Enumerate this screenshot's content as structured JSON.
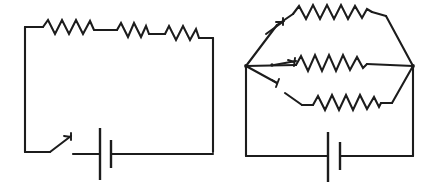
{
  "figure": {
    "title": "Two resistor circuit schematics",
    "background_color": "#ffffff",
    "line_color": "#1c1c1c",
    "width": 441,
    "height": 187
  },
  "circuits": [
    {
      "id": "left-circuit",
      "name": "series-circuit",
      "description": "Single loop with three resistors in series along the top, an open knife switch and one battery cell along the bottom.",
      "components": {
        "resistor_count": 3,
        "battery_cell_count": 1,
        "switch_count": 1,
        "switch_state": "open",
        "branch_count": 1,
        "resistors": [
          {
            "name": "resistor-1",
            "position": "top-left",
            "zigzag_peaks": 4
          },
          {
            "name": "resistor-2",
            "position": "top-center",
            "zigzag_peaks": 4
          },
          {
            "name": "resistor-3",
            "position": "top-right",
            "zigzag_peaks": 4
          }
        ],
        "battery": {
          "name": "battery-cell",
          "position": "bottom-center",
          "plates": 2
        },
        "switch": {
          "name": "knife-switch",
          "position": "bottom-left",
          "blade_direction": "up-right"
        }
      }
    },
    {
      "id": "right-circuit",
      "name": "parallel-circuit",
      "description": "Three parallel branches fanning out from a left node to a right node, each branch containing one resistor and a switch, with one battery cell on the bottom rail.",
      "components": {
        "resistor_count": 3,
        "battery_cell_count": 1,
        "switch_count": 3,
        "switch_state": "open",
        "branch_count": 3,
        "branches": [
          {
            "name": "branch-top",
            "resistor": "resistor-top",
            "switch": "switch-top",
            "zigzag_peaks": 4
          },
          {
            "name": "branch-middle",
            "resistor": "resistor-middle",
            "switch": "switch-middle",
            "zigzag_peaks": 4
          },
          {
            "name": "branch-bottom",
            "resistor": "resistor-bottom",
            "switch": "switch-bottom",
            "zigzag_peaks": 4
          }
        ],
        "nodes": [
          {
            "name": "left-junction-node"
          },
          {
            "name": "right-junction-node"
          }
        ],
        "battery": {
          "name": "battery-cell",
          "position": "bottom-center",
          "plates": 2
        }
      }
    }
  ]
}
